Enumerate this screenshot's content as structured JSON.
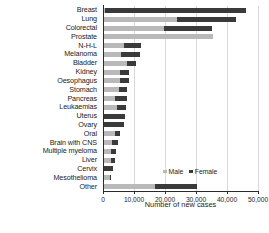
{
  "chart_data": {
    "type": "bar",
    "orientation": "horizontal",
    "stacked": true,
    "title": "",
    "xlabel": "Number of new cases",
    "ylabel": "",
    "xlim": [
      0,
      50000
    ],
    "xticks": [
      0,
      10000,
      20000,
      30000,
      40000,
      50000
    ],
    "xtick_labels": [
      "0",
      "10,000",
      "20,000",
      "30,000",
      "40,000",
      "50,000"
    ],
    "grid": true,
    "grid_axis": "x",
    "legend": [
      "Male",
      "Female"
    ],
    "legend_position": "inside lower right",
    "colors": {
      "male": "#b9b9b9",
      "female": "#3a3a3a"
    },
    "categories": [
      "Breast",
      "Lung",
      "Colorectal",
      "Prostate",
      "N-H-L",
      "Melanoma",
      "Bladder",
      "Kidney",
      "Oesophagus",
      "Stomach",
      "Pancreas",
      "Leukaemias",
      "Uterus",
      "Ovary",
      "Oral",
      "Brain with CNS",
      "Multiple myeloma",
      "Liver",
      "Cervix",
      "Mesothelioma",
      "Other"
    ],
    "series": [
      {
        "name": "Male",
        "values": [
          350,
          23500,
          19500,
          35000,
          6500,
          5500,
          7500,
          5000,
          5300,
          4800,
          3700,
          4200,
          0,
          0,
          3400,
          2500,
          2300,
          2300,
          0,
          1900,
          16500
        ]
      },
      {
        "name": "Female",
        "values": [
          45500,
          19000,
          15500,
          0,
          5500,
          6000,
          2800,
          3000,
          2700,
          2700,
          3800,
          2800,
          6900,
          6500,
          1700,
          1900,
          1700,
          1100,
          2800,
          400,
          13500
        ]
      }
    ],
    "totals": [
      45850,
      42500,
      35000,
      35000,
      12000,
      11500,
      10300,
      8000,
      8000,
      7500,
      7500,
      7000,
      6900,
      6500,
      5100,
      4400,
      4000,
      3400,
      2800,
      2300,
      30000
    ]
  }
}
